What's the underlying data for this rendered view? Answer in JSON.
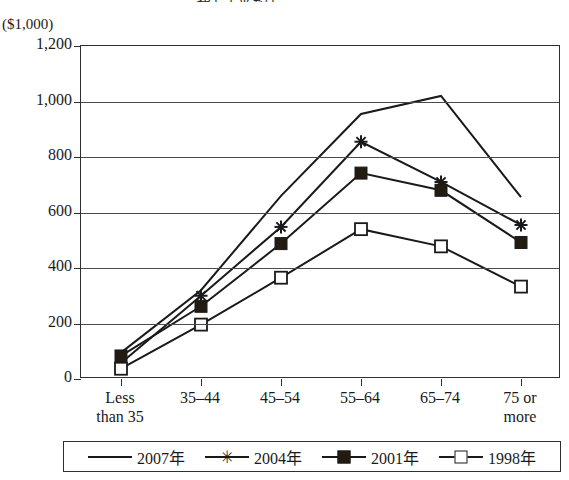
{
  "cropped_title": "費）（平均）",
  "axis": {
    "unit_label": "($1,000)",
    "y_ticks": [
      "1,200",
      "1,000",
      "800",
      "600",
      "400",
      "200",
      "0"
    ],
    "x_labels": [
      "Less\nthan 35",
      "35–44",
      "45–54",
      "55–64",
      "65–74",
      "75 or\nmore"
    ]
  },
  "legend": {
    "items": [
      {
        "label": "2007年",
        "marker": "line",
        "color": "#1a1a1a"
      },
      {
        "label": "2004年",
        "marker": "star-marker",
        "color": "#1a1a1a"
      },
      {
        "label": "2001年",
        "marker": "filled-square-marker",
        "color": "#231a12"
      },
      {
        "label": "1998年",
        "marker": "open-square-marker",
        "color": "#ffffff"
      }
    ]
  },
  "chart_data": {
    "type": "line",
    "title": "費）（平均）",
    "xlabel": "",
    "ylabel": "($1,000)",
    "ylim": [
      0,
      1200
    ],
    "ytick_step": 200,
    "grid": true,
    "legend_position": "bottom",
    "categories": [
      "Less than 35",
      "35–44",
      "45–54",
      "55–64",
      "65–74",
      "75 or more"
    ],
    "series": [
      {
        "name": "2007年",
        "marker": "none",
        "values": [
          95,
          320,
          660,
          955,
          1020,
          655
        ]
      },
      {
        "name": "2004年",
        "marker": "star",
        "values": [
          58,
          300,
          548,
          855,
          710,
          555
        ]
      },
      {
        "name": "2001年",
        "marker": "filled-square",
        "values": [
          83,
          262,
          488,
          742,
          680,
          492
        ]
      },
      {
        "name": "1998年",
        "marker": "open-square",
        "values": [
          37,
          196,
          365,
          540,
          478,
          333
        ]
      }
    ]
  }
}
